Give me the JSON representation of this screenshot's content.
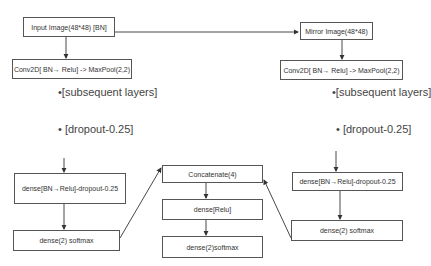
{
  "diagram": {
    "left_branch": {
      "input": "Input Image(48*48) [BN]",
      "conv": "Conv2D[ BN→ Relu] -> MaxPool(2,2)",
      "subsequent": "•[subsequent layers]",
      "dropout": "• [dropout-0.25]",
      "dense": "dense[BN→Relu]-dropout-0.25",
      "softmax": "dense(2) softmax"
    },
    "right_branch": {
      "input": "Mirror Image(48*48)",
      "conv": "Conv2D[ BN→ Relu] -> MaxPool(2,2)",
      "subsequent": "•[subsequent layers]",
      "dropout": "• [dropout-0.25]",
      "dense": "dense[BN→Relu]-dropout-0.25",
      "softmax": "dense(2) softmax"
    },
    "merge": {
      "concat": "Concatenate(4)",
      "dense": "dense[Relu]",
      "softmax": "dense(2)softmax"
    }
  }
}
